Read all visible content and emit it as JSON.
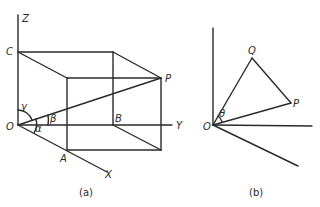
{
  "figure_a": {
    "caption": "(a)",
    "axes": {
      "z": "Z",
      "y": "Y",
      "x": "X"
    },
    "points": {
      "origin": "O",
      "c": "C",
      "p": "P",
      "a": "A",
      "b": "B"
    },
    "angles": {
      "alpha": "α",
      "beta": "β",
      "gamma": "γ"
    }
  },
  "figure_b": {
    "caption": "(b)",
    "points": {
      "origin": "O",
      "q": "Q",
      "p": "P"
    },
    "angles": {
      "theta": "θ"
    }
  }
}
